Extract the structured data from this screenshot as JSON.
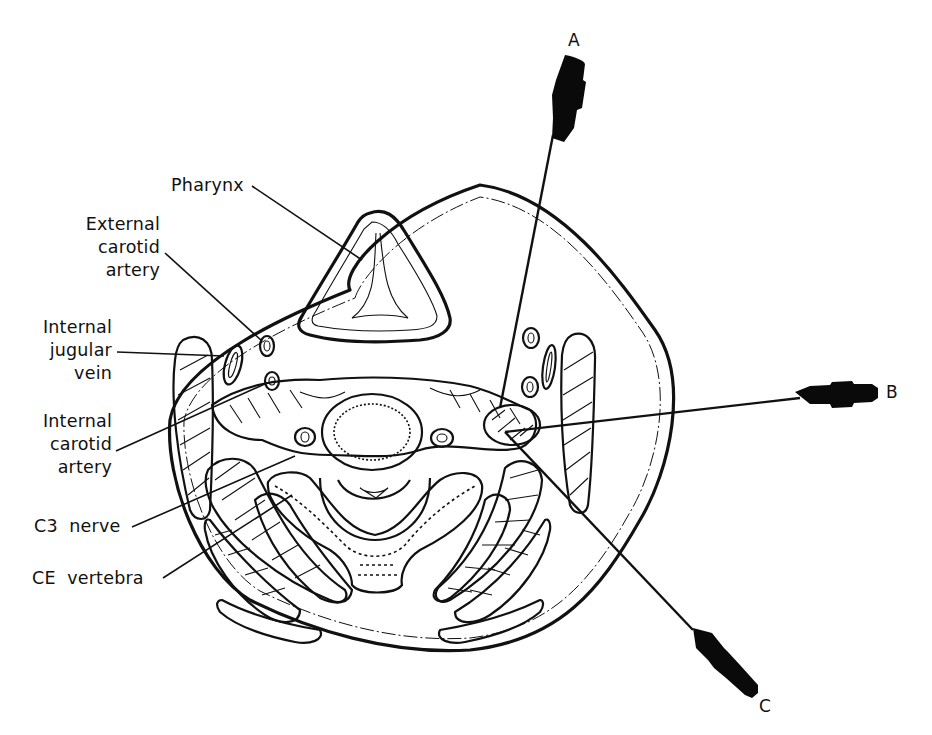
{
  "figure": {
    "type": "anatomical cross-section",
    "colors": {
      "line": "#111111",
      "background": "#ffffff"
    }
  },
  "labels": {
    "pharynx": "Pharynx",
    "external_carotid_artery": [
      "External",
      "carotid",
      "artery"
    ],
    "internal_jugular_vein": [
      "Internal",
      "jugular",
      "vein"
    ],
    "internal_carotid_artery": [
      "Internal",
      "carotid",
      "artery"
    ],
    "c3_nerve": "C3  nerve",
    "ce_vertebra": "CE  vertebra"
  },
  "needles": [
    {
      "id": "A",
      "label": "A"
    },
    {
      "id": "B",
      "label": "B"
    },
    {
      "id": "C",
      "label": "C"
    }
  ]
}
